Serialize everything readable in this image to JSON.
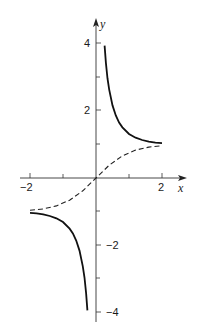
{
  "chart_data": {
    "type": "line",
    "title": "",
    "xlabel": "x",
    "ylabel": "y",
    "xlim": [
      -2.0,
      2.65
    ],
    "ylim": [
      -4.3,
      4.7
    ],
    "grid": false,
    "legend": null,
    "x_ticks": [
      -2,
      -1,
      1,
      2
    ],
    "x_tick_labels": [
      "-2",
      "2"
    ],
    "y_ticks": [
      -4,
      -3,
      -2,
      -1,
      1,
      2,
      3,
      4
    ],
    "y_tick_labels": [
      "4",
      "2",
      "-2",
      "-4"
    ],
    "series": [
      {
        "name": "y = coth x",
        "style": "solid",
        "branches": [
          {
            "x": [
              0.26,
              0.3,
              0.35,
              0.4,
              0.5,
              0.6,
              0.7,
              0.8,
              1.0,
              1.2,
              1.4,
              1.6,
              1.8,
              2.0
            ],
            "y": [
              3.94,
              3.43,
              2.96,
              2.63,
              2.16,
              1.86,
              1.65,
              1.51,
              1.31,
              1.2,
              1.13,
              1.08,
              1.05,
              1.04
            ]
          },
          {
            "x": [
              -2.0,
              -1.8,
              -1.6,
              -1.4,
              -1.2,
              -1.0,
              -0.8,
              -0.7,
              -0.6,
              -0.5,
              -0.4,
              -0.35,
              -0.3,
              -0.26
            ],
            "y": [
              -1.04,
              -1.05,
              -1.08,
              -1.13,
              -1.2,
              -1.31,
              -1.51,
              -1.65,
              -1.86,
              -2.16,
              -2.63,
              -2.96,
              -3.43,
              -3.94
            ]
          }
        ]
      },
      {
        "name": "y = tanh x",
        "style": "dashed",
        "x": [
          -2.0,
          -1.6,
          -1.2,
          -0.8,
          -0.4,
          0,
          0.4,
          0.8,
          1.2,
          1.6,
          2.0
        ],
        "y": [
          -0.96,
          -0.92,
          -0.83,
          -0.66,
          -0.38,
          0,
          0.38,
          0.66,
          0.83,
          0.92,
          0.96
        ]
      }
    ]
  },
  "labels": {
    "x_axis": "x",
    "y_axis": "y",
    "x_neg2": "−2",
    "x_pos2": "2",
    "y_4": "4",
    "y_2": "2",
    "y_neg2": "−2",
    "y_neg4": "−4"
  }
}
